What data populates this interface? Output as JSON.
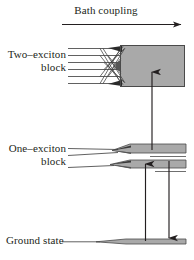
{
  "figure": {
    "type": "energy-level-diagram",
    "width": 194,
    "height": 260,
    "background_color": "#ffffff",
    "ink_color": "#231f20",
    "band_fill_color": "#a8a8a8",
    "band_edge_color": "#333333"
  },
  "labels": {
    "bath_coupling": "Bath coupling",
    "two_exciton_line1": "Two–exciton",
    "two_exciton_line2": "block",
    "one_exciton_line1": "One–exciton",
    "one_exciton_line2": "block",
    "ground_state": "Ground state"
  },
  "diagram_data": {
    "type": "energy-level-diagram",
    "description": "Exciton manifold energy diagram with ground state, one-exciton block and two-exciton block; bath coupling broadens discrete levels into quasi-continuum bands.",
    "axis": {
      "name": "bath-coupling-axis",
      "label": "Bath coupling",
      "direction": "left-to-right",
      "arrow_head": "right",
      "x_start": 62,
      "x_end": 186,
      "y": 24
    },
    "manifolds": [
      {
        "name": "two-exciton-block",
        "label_lines": [
          "Two–exciton",
          "block"
        ],
        "level_count": 6,
        "discrete_levels_y": [
          48,
          55,
          62,
          69,
          76,
          83
        ],
        "levels_x_start": 68,
        "levels_x_converge": 120,
        "band_box": {
          "x": 120,
          "y": 45,
          "width": 65,
          "height": 42
        },
        "band_filled": true,
        "outlined": true
      },
      {
        "name": "one-exciton-block",
        "label_lines": [
          "One–exciton",
          "block"
        ],
        "level_count": 3,
        "discrete_levels_y": [
          148,
          155,
          167
        ],
        "levels_x_start": 68,
        "levels_x_converge": 130,
        "bands": [
          {
            "x": 130,
            "y": 144,
            "width": 56,
            "height": 9
          },
          {
            "x": 130,
            "y": 160,
            "width": 56,
            "height": 8
          }
        ],
        "band_filled": true,
        "outlined": false
      },
      {
        "name": "ground-state",
        "label_lines": [
          "Ground state"
        ],
        "level_count": 1,
        "discrete_levels_y": [
          242
        ],
        "levels_x_start": 62,
        "levels_x_converge": 126,
        "bands": [
          {
            "x": 126,
            "y": 239,
            "width": 60,
            "height": 5
          }
        ],
        "band_filled": true,
        "outlined": false
      }
    ],
    "transitions": [
      {
        "name": "one-to-two-exciton-absorption",
        "from": "one-exciton-block",
        "to": "two-exciton-block",
        "direction": "up",
        "x": 152,
        "y_start": 150,
        "y_end": 68
      },
      {
        "name": "ground-to-one-exciton-absorption",
        "from": "ground-state",
        "to": "one-exciton-block",
        "direction": "up",
        "x": 145,
        "y_start": 242,
        "y_end": 160
      },
      {
        "name": "one-exciton-to-ground-emission",
        "from": "one-exciton-block",
        "to": "ground-state",
        "direction": "down",
        "x": 169,
        "y_start": 160,
        "y_end": 242
      }
    ]
  }
}
